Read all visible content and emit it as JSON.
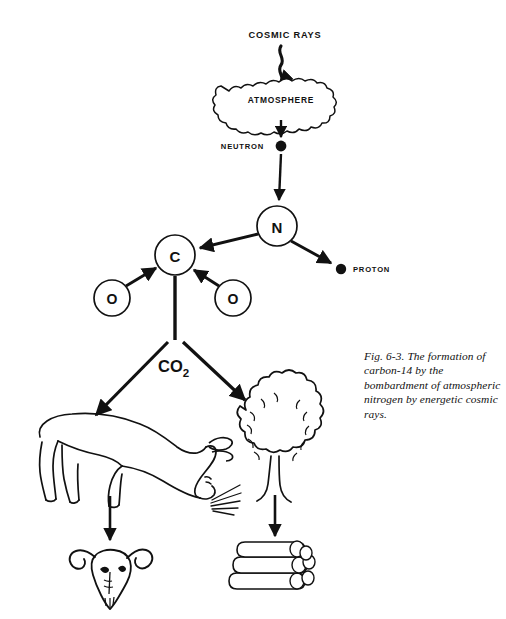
{
  "figure": {
    "caption": "Fig. 6-3. The formation of carbon-14 by the bombardment of atmospheric nitrogen by energetic cosmic rays.",
    "caption_lines": [
      "Fig. 6-3. The formation of",
      "carbon-14 by the",
      "bombardment of",
      "atmospheric nitrogen by",
      "energetic cosmic rays."
    ],
    "background_color": "#ffffff",
    "ink_color": "#111111"
  },
  "labels": {
    "cosmic_rays": "COSMIC RAYS",
    "atmosphere": "ATMOSPHERE",
    "neutron": "NEUTRON",
    "proton": "PROTON",
    "nitrogen_symbol": "N",
    "carbon_symbol": "C",
    "oxygen_left_symbol": "O",
    "oxygen_right_symbol": "O",
    "co2_formula": "CO",
    "co2_subscript": "2"
  },
  "nodes": [
    {
      "id": "cosmic-rays",
      "label": "COSMIC RAYS",
      "type": "text-label",
      "x": 285,
      "y": 35
    },
    {
      "id": "atmosphere",
      "label": "ATMOSPHERE",
      "type": "cloud",
      "x": 280,
      "y": 100
    },
    {
      "id": "neutron",
      "label": "NEUTRON",
      "type": "particle-dot",
      "x": 252,
      "y": 146
    },
    {
      "id": "nitrogen",
      "label": "N",
      "type": "circle-atom",
      "x": 277,
      "y": 226,
      "r": 20
    },
    {
      "id": "proton",
      "label": "PROTON",
      "type": "particle-dot",
      "x": 341,
      "y": 269
    },
    {
      "id": "carbon",
      "label": "C",
      "type": "circle-atom",
      "x": 175,
      "y": 255,
      "r": 20
    },
    {
      "id": "oxygen-left",
      "label": "O",
      "type": "circle-atom",
      "x": 112,
      "y": 298,
      "r": 18
    },
    {
      "id": "oxygen-right",
      "label": "O",
      "type": "circle-atom",
      "x": 233,
      "y": 298,
      "r": 18
    },
    {
      "id": "carbon-dioxide",
      "label": "CO2",
      "type": "text-label",
      "x": 178,
      "y": 365
    },
    {
      "id": "cow",
      "label": "grazing cow",
      "type": "illustration",
      "x": 110,
      "y": 455
    },
    {
      "id": "tree",
      "label": "tree",
      "type": "illustration",
      "x": 275,
      "y": 440
    },
    {
      "id": "skull",
      "label": "animal skull",
      "type": "illustration",
      "x": 110,
      "y": 560
    },
    {
      "id": "logs",
      "label": "stacked logs",
      "type": "illustration",
      "x": 275,
      "y": 570
    }
  ],
  "edges": [
    {
      "from": "cosmic-rays",
      "to": "atmosphere",
      "style": "wavy-arrow"
    },
    {
      "from": "atmosphere",
      "to": "neutron",
      "style": "straight-arrow"
    },
    {
      "from": "neutron",
      "to": "nitrogen",
      "style": "straight-arrow"
    },
    {
      "from": "nitrogen",
      "to": "carbon",
      "style": "straight-arrow"
    },
    {
      "from": "nitrogen",
      "to": "proton",
      "style": "straight-arrow"
    },
    {
      "from": "oxygen-left",
      "to": "carbon",
      "style": "straight-arrow"
    },
    {
      "from": "oxygen-right",
      "to": "carbon",
      "style": "straight-arrow"
    },
    {
      "from": "carbon",
      "to": "carbon-dioxide",
      "style": "stem"
    },
    {
      "from": "carbon-dioxide",
      "to": "cow",
      "style": "straight-arrow"
    },
    {
      "from": "carbon-dioxide",
      "to": "tree",
      "style": "straight-arrow"
    },
    {
      "from": "cow",
      "to": "skull",
      "style": "straight-arrow"
    },
    {
      "from": "tree",
      "to": "logs",
      "style": "straight-arrow"
    }
  ]
}
